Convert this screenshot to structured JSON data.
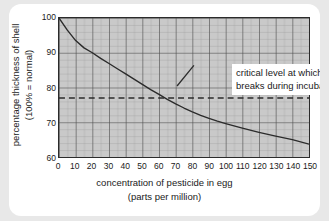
{
  "chart_data": {
    "type": "line",
    "title": "",
    "xlabel": "concentration of pesticide in egg",
    "xlabel_units": "(parts per million)",
    "ylabel": "percentage thickness of shell",
    "ylabel_units": "(100% = normal)",
    "xlim": [
      0,
      150
    ],
    "ylim": [
      60,
      100
    ],
    "xticks": [
      0,
      10,
      20,
      30,
      40,
      50,
      60,
      70,
      80,
      90,
      100,
      110,
      120,
      130,
      140,
      150
    ],
    "yticks": [
      60,
      70,
      80,
      90,
      100
    ],
    "grid": "major and minor, 5 minor divisions per major cell",
    "legend": "none",
    "plot_background": "#c9c9c9",
    "line_color": "#2b2b2b",
    "series": [
      {
        "name": "shell thickness vs pesticide concentration",
        "x": [
          0,
          5,
          10,
          15,
          20,
          25,
          30,
          35,
          40,
          45,
          50,
          55,
          60,
          65,
          70,
          75,
          80,
          85,
          90,
          95,
          100,
          110,
          120,
          130,
          140,
          150
        ],
        "values": [
          100,
          96.5,
          93.5,
          91.4,
          90.0,
          88.4,
          86.9,
          85.4,
          83.9,
          82.4,
          80.9,
          79.4,
          78.0,
          76.6,
          75.3,
          74.1,
          73.0,
          72.0,
          71.1,
          70.3,
          69.6,
          68.3,
          67.1,
          66.0,
          65.0,
          63.7
        ]
      }
    ],
    "reference_line": {
      "orientation": "horizontal",
      "value": 77,
      "style": "dashed",
      "color": "#2b2b2b",
      "label_line1": "critical level at which shell",
      "label_line2": "breaks during incubation"
    }
  }
}
